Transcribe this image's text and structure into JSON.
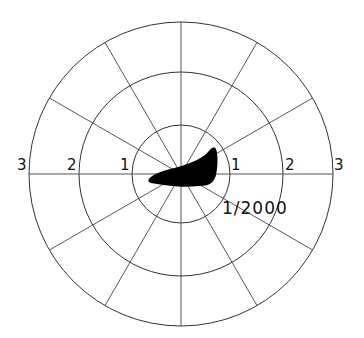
{
  "diagram": {
    "type": "polar-grid",
    "rings": [
      1,
      2,
      3
    ],
    "spoke_angle_step_deg": 30,
    "left_labels": [
      "3",
      "2",
      "1"
    ],
    "right_labels": [
      "1",
      "2",
      "3"
    ],
    "annotation": "1/2000",
    "shape_fill": "#000000",
    "line_color": "#333333"
  }
}
